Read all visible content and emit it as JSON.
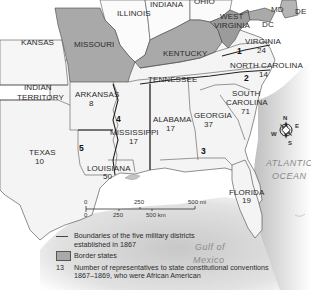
{
  "map": {
    "states": [
      {
        "name": "ILLINOIS",
        "border_state": false
      },
      {
        "name": "INDIANA",
        "border_state": false
      },
      {
        "name": "OHIO",
        "border_state": false
      },
      {
        "name": "MD",
        "border_state": true
      },
      {
        "name": "DE",
        "border_state": true
      },
      {
        "name": "DC",
        "border_state": false
      },
      {
        "name": "WEST VIRGINIA",
        "border_state": true
      },
      {
        "name": "KANSAS",
        "border_state": false
      },
      {
        "name": "MISSOURI",
        "border_state": true
      },
      {
        "name": "KENTUCKY",
        "border_state": true
      },
      {
        "name": "VIRGINIA",
        "representatives": "24"
      },
      {
        "name": "NORTH CAROLINA",
        "representatives": "14"
      },
      {
        "name": "TENNESSEE"
      },
      {
        "name": "INDIAN TERRITORY"
      },
      {
        "name": "ARKANSAS",
        "representatives": "8"
      },
      {
        "name": "SOUTH CAROLINA",
        "representatives": "71"
      },
      {
        "name": "ALABAMA",
        "representatives": "17"
      },
      {
        "name": "GEORGIA",
        "representatives": "37"
      },
      {
        "name": "MISSISSIPPI",
        "representatives": "17"
      },
      {
        "name": "TEXAS",
        "representatives": "10"
      },
      {
        "name": "LOUISIANA",
        "representatives": "50"
      },
      {
        "name": "FLORIDA",
        "representatives": "19"
      }
    ],
    "labels": {
      "illinois": "ILLINOIS",
      "indiana": "INDIANA",
      "ohio": "OHIO",
      "md": "MD",
      "de": "DE",
      "dc": "DC",
      "west_virginia_1": "WEST",
      "west_virginia_2": "VIRGINIA",
      "kansas": "KANSAS",
      "missouri": "MISSOURI",
      "kentucky": "KENTUCKY",
      "virginia": "VIRGINIA",
      "virginia_num": "24",
      "north_carolina": "NORTH CAROLINA",
      "north_carolina_num": "14",
      "tennessee": "TENNESSEE",
      "indian_territory_1": "INDIAN",
      "indian_territory_2": "TERRITORY",
      "arkansas": "ARKANSAS",
      "arkansas_num": "8",
      "south_carolina_1": "SOUTH",
      "south_carolina_2": "CAROLINA",
      "south_carolina_num": "71",
      "alabama": "ALABAMA",
      "alabama_num": "17",
      "georgia": "GEORGIA",
      "georgia_num": "37",
      "mississippi": "MISSISSIPPI",
      "mississippi_num": "17",
      "texas": "TEXAS",
      "texas_num": "10",
      "louisiana": "LOUISIANA",
      "louisiana_num": "50",
      "florida": "FLORIDA",
      "florida_num": "19"
    },
    "military_districts": [
      "1",
      "2",
      "3",
      "4",
      "5"
    ],
    "water": {
      "atlantic_1": "ATLANTIC",
      "atlantic_2": "OCEAN",
      "gulf_1": "Gulf of",
      "gulf_2": "Mexico"
    },
    "compass": {
      "n": "N",
      "e": "E",
      "s": "S",
      "w": "W"
    },
    "scale": {
      "mi_ticks": [
        "0",
        "250",
        "500 mi"
      ],
      "km_ticks": [
        "0",
        "250",
        "500 km"
      ]
    },
    "colors": {
      "border_state_fill": "#a9a9a9",
      "land_fill": "#f4f4f4",
      "water_fill": "#d9d9d9",
      "boundary": "#333333"
    }
  },
  "legend": {
    "district_boundaries": "Boundaries of the five military districts established in 1867",
    "border_states": "Border states",
    "number_key": "13",
    "number_text": "Number of representatives to state constitutional conventions 1867–1869, who were African American"
  }
}
